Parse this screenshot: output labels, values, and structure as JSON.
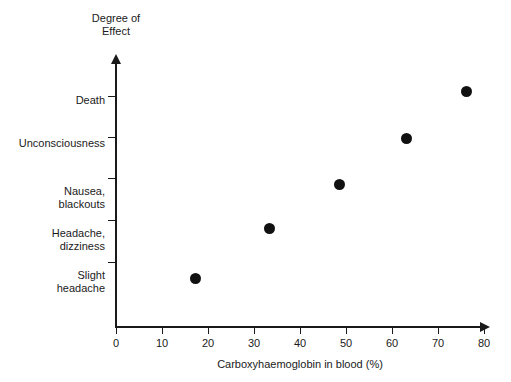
{
  "chart_data": {
    "type": "scatter",
    "title": "",
    "xlabel": "Carboxyhaemoglobin in blood (%)",
    "ylabel": "Degree of\nEffect",
    "ylabel_line1": "Degree of",
    "ylabel_line2": "Effect",
    "xlim": [
      0,
      80
    ],
    "xticks": [
      0,
      10,
      20,
      30,
      40,
      50,
      60,
      70,
      80
    ],
    "xticklabels": [
      "0",
      "10",
      "20",
      "30",
      "40",
      "50",
      "60",
      "70",
      "80"
    ],
    "yticklabels": [
      "Slight\nheadache",
      "Headache,\ndizziness",
      "Nausea,\nblackouts",
      "Unconsciousness",
      "Death"
    ],
    "ycategories": [
      "Slight headache",
      "Headache, dizziness",
      "Nausea, blackouts",
      "Unconsciousness",
      "Death"
    ],
    "grid": false,
    "legend": "none",
    "marker_color": "#111111",
    "axis_color": "#1a1a1a",
    "background": "#ffffff",
    "x": [
      17,
      33,
      48,
      62,
      75
    ],
    "y": [
      1,
      2,
      3,
      4,
      5
    ],
    "points": [
      {
        "x": 17,
        "category": "Slight headache",
        "px": 195,
        "py": 278
      },
      {
        "x": 33,
        "category": "Headache, dizziness",
        "px": 269,
        "py": 228
      },
      {
        "x": 48,
        "category": "Nausea, blackouts",
        "px": 339,
        "py": 184
      },
      {
        "x": 62,
        "category": "Unconsciousness",
        "px": 406,
        "py": 138
      },
      {
        "x": 75,
        "category": "Death",
        "px": 466,
        "py": 91
      }
    ],
    "ytick_positions_px": [
      262,
      220,
      178,
      137,
      96
    ],
    "xtick_positions_px": [
      116,
      162,
      208,
      254,
      300,
      346,
      392,
      438,
      484
    ]
  }
}
